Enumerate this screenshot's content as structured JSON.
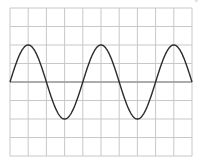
{
  "chart_data": {
    "type": "line",
    "title": "",
    "xlabel": "",
    "ylabel": "",
    "grid": true,
    "grid_divisions": {
      "x": 10,
      "y": 8
    },
    "xlim": [
      0,
      10
    ],
    "ylim": [
      -4,
      4
    ],
    "series": [
      {
        "name": "sine wave",
        "function": "y = 2*sin(2*pi*x/4)",
        "amplitude": 2,
        "period": 4,
        "phase": 0,
        "x": [
          0,
          1,
          2,
          3,
          4,
          5,
          6,
          7,
          8,
          9,
          10
        ],
        "values": [
          0,
          2,
          0,
          -2,
          0,
          2,
          0,
          -2,
          0,
          2,
          0
        ],
        "color": "#2b2b2b"
      }
    ],
    "axis_line": {
      "y": 0,
      "color": "#9a9a9a"
    }
  },
  "colors": {
    "background": "#ffffff",
    "grid": "#c8c8c8",
    "axis": "#9a9a9a",
    "curve": "#2b2b2b"
  },
  "corner_glyph": "°"
}
